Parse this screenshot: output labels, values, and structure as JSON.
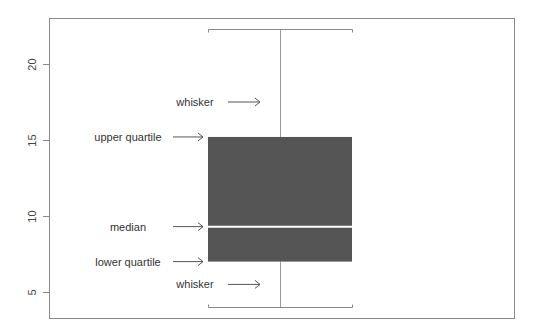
{
  "chart_data": {
    "type": "box",
    "title": "",
    "xlabel": "",
    "ylabel": "",
    "ylim": [
      3.3,
      23.2
    ],
    "yticks": [
      5,
      10,
      15,
      20
    ],
    "ytick_labels": [
      "5",
      "10",
      "15",
      "20"
    ],
    "grid": false,
    "legend": null,
    "box": {
      "lower_whisker": 4.0,
      "lower_quartile": 7.0,
      "median": 9.3,
      "upper_quartile": 15.2,
      "upper_whisker": 22.3
    },
    "annotations": [
      {
        "label": "whisker",
        "target": "upper_whisker_region",
        "y": 17.5
      },
      {
        "label": "upper quartile",
        "target": "upper_quartile",
        "y": 15.2
      },
      {
        "label": "median",
        "target": "median",
        "y": 9.3
      },
      {
        "label": "lower quartile",
        "target": "lower_quartile",
        "y": 7.0
      },
      {
        "label": "whisker",
        "target": "lower_whisker_region",
        "y": 5.5
      }
    ],
    "colors": {
      "box_fill": "#555555",
      "median_line": "#ffffff",
      "whisker": "#888888",
      "frame": "#888888",
      "text": "#333333"
    }
  }
}
